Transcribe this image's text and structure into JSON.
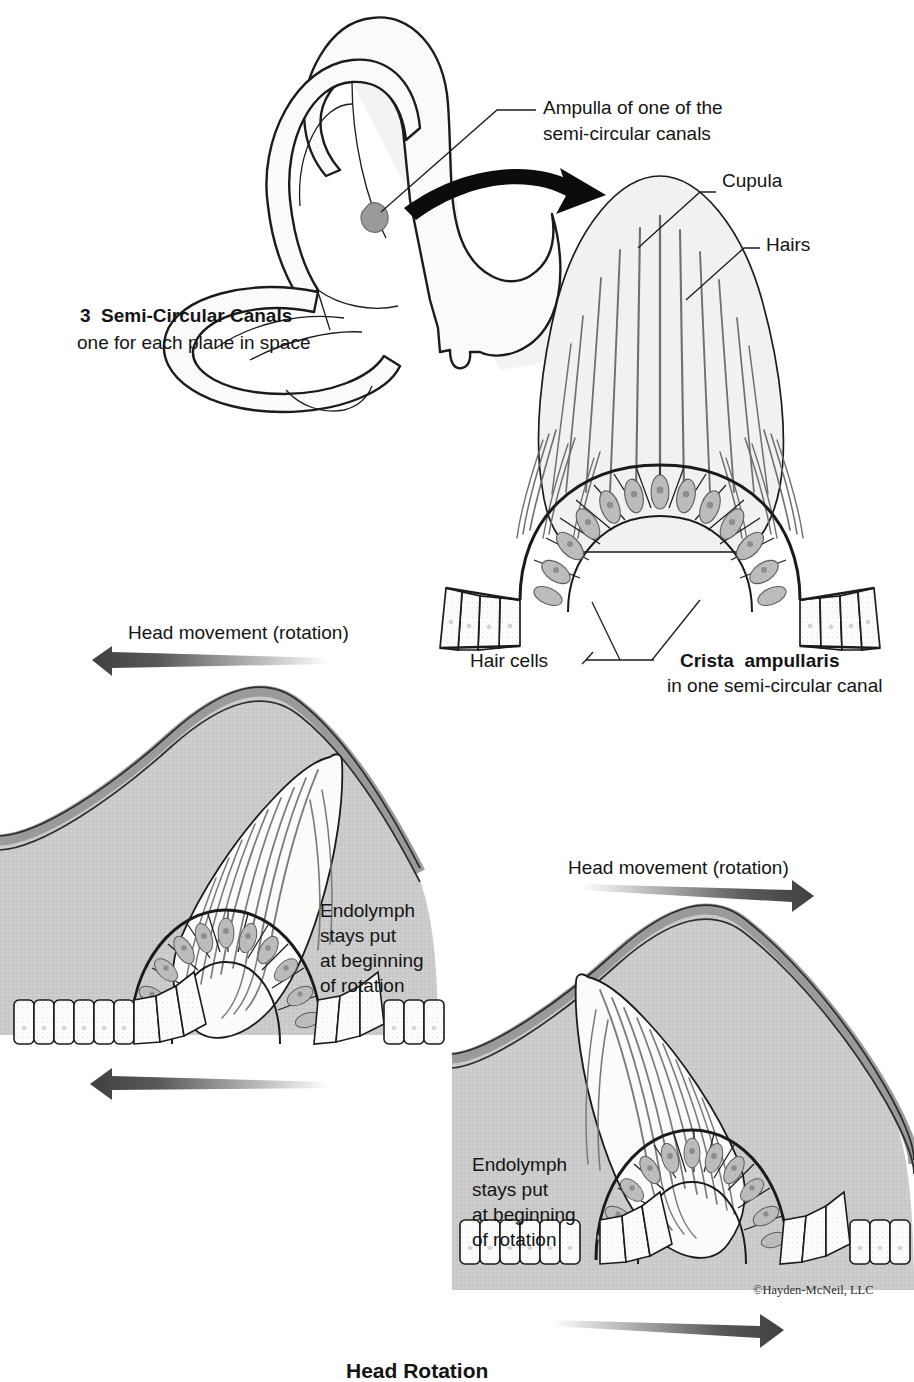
{
  "figure": {
    "copyright": "©Hayden-McNeil, LLC",
    "bottom_caption": "Head Rotation"
  },
  "colors": {
    "ink": "#1b1b1b",
    "canal_fill": "#e2e2e2",
    "cupula_fill": "#f1f1ef",
    "endolymph_fill": "#c9c9c9",
    "membrane_fill": "#b6b6b6",
    "hair_cell_fill": "#b9b9b9",
    "support_cell_fill": "#fbfbfa",
    "arrow_dark": "#4a4a4a",
    "hair_line": "#6e6e6e",
    "background": "#ffffff"
  },
  "panels": {
    "canals": {
      "name": "semi-circular-canals",
      "caption_bold": "3  Semi-Circular Canals",
      "caption_sub": "one for each plane in space",
      "callout": {
        "line1": "Ampulla of one of the",
        "line2": "semi-circular canals"
      }
    },
    "crista": {
      "name": "crista-ampullaris-detail",
      "labels": {
        "cupula": "Cupula",
        "hairs": "Hairs",
        "hair_cells": "Hair cells"
      },
      "caption_bold": "Crista  ampullaris",
      "caption_sub": "in one semi-circular canal"
    },
    "rotation_left": {
      "name": "rotation-left-panel",
      "top_label": "Head movement (rotation)",
      "annotation": "Endolymph\nstays put\nat beginning\nof rotation",
      "annotation_lines": [
        "Endolymph",
        "stays put",
        "at beginning",
        "of rotation"
      ],
      "direction": "left"
    },
    "rotation_right": {
      "name": "rotation-right-panel",
      "top_label": "Head movement (rotation)",
      "annotation_lines": [
        "Endolymph",
        "stays put",
        "at beginning",
        "of rotation"
      ],
      "direction": "right"
    }
  }
}
